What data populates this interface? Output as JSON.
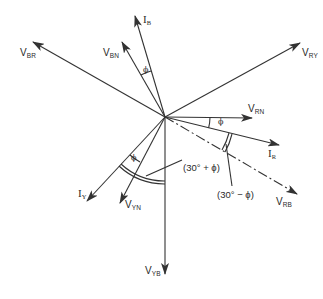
{
  "diagram": {
    "type": "phasor-diagram",
    "center": [
      165,
      117
    ],
    "stroke_color": "#333333",
    "phasors": [
      {
        "id": "V_RY",
        "main": "V",
        "sub": "RY",
        "tip": [
          300,
          43
        ],
        "style": "solid"
      },
      {
        "id": "V_RN",
        "main": "V",
        "sub": "RN",
        "tip": [
          252,
          118
        ],
        "style": "solid"
      },
      {
        "id": "I_R",
        "main": "I",
        "sub": "R",
        "tip": [
          279,
          145
        ],
        "style": "solid"
      },
      {
        "id": "V_RB",
        "main": "V",
        "sub": "RB",
        "tip": [
          297,
          194
        ],
        "style": "dash-dot"
      },
      {
        "id": "V_YB",
        "main": "V",
        "sub": "YB",
        "tip": [
          165,
          274
        ],
        "style": "solid"
      },
      {
        "id": "V_YN",
        "main": "V",
        "sub": "YN",
        "tip": [
          120,
          203
        ],
        "style": "solid"
      },
      {
        "id": "I_Y",
        "main": "I",
        "sub": "Y",
        "tip": [
          87,
          201
        ],
        "style": "solid"
      },
      {
        "id": "V_BN",
        "main": "V",
        "sub": "BN",
        "tip": [
          122,
          42
        ],
        "style": "solid"
      },
      {
        "id": "I_B",
        "main": "I",
        "sub": "B",
        "tip": [
          135,
          16
        ],
        "style": "solid"
      },
      {
        "id": "V_BR",
        "main": "V",
        "sub": "BR",
        "tip": [
          33,
          42
        ],
        "style": "solid"
      }
    ],
    "labels": {
      "v_ry": {
        "main": "V",
        "sub": "RY"
      },
      "v_rn": {
        "main": "V",
        "sub": "RN"
      },
      "i_r": {
        "main": "I",
        "sub": "R"
      },
      "v_rb": {
        "main": "V",
        "sub": "RB"
      },
      "v_yb": {
        "main": "V",
        "sub": "YB"
      },
      "v_yn": {
        "main": "V",
        "sub": "YN"
      },
      "i_y": {
        "main": "I",
        "sub": "Y"
      },
      "v_bn": {
        "main": "V",
        "sub": "BN"
      },
      "i_b": {
        "main": "I",
        "sub": "B"
      },
      "v_br": {
        "main": "V",
        "sub": "BR"
      }
    },
    "angle_marks": {
      "phi_r": "ϕ",
      "phi_b": "ϕ",
      "phi_y": "ϕ"
    },
    "annotations": {
      "thirty_plus_phi": "(30° + ϕ)",
      "thirty_minus_phi": "(30° − ϕ)"
    }
  }
}
